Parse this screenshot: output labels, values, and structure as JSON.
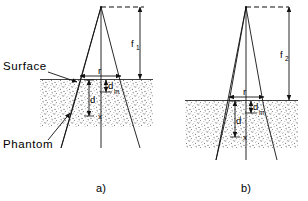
{
  "figure": {
    "title": "",
    "labels": {
      "surface": "Surface",
      "phantom": "Phantom"
    },
    "captions": {
      "panel_a": "a)",
      "panel_b": "b)"
    },
    "symbols": {
      "f1_base": "f",
      "f1_sub": "1",
      "f2_base": "f",
      "f2_sub": "2",
      "radius": "r",
      "depth": "d",
      "depth_max_base": "d",
      "depth_max_sub": "m",
      "point": "x"
    },
    "colors": {
      "line": "#111111",
      "background": "#ffffff",
      "phantom_fill": "#bfbfbf"
    },
    "panels": [
      {
        "id": "a",
        "caption": "a)",
        "distance_label": "f1",
        "field_radius_label": "r",
        "depth_label": "d",
        "depth_max_label": "dm",
        "measurement_point_label": "x"
      },
      {
        "id": "b",
        "caption": "b)",
        "distance_label": "f2",
        "field_radius_label": "r",
        "depth_label": "d",
        "depth_max_label": "dm",
        "measurement_point_label": "x"
      }
    ]
  }
}
